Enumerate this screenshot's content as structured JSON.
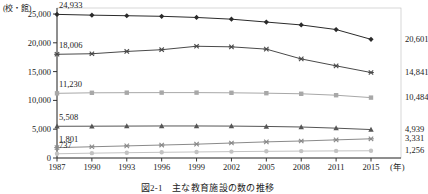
{
  "figure": {
    "unit_label": "(校・館)",
    "x_axis_unit": "(年)",
    "caption": "図2-1　主な教育施設の数の推移"
  },
  "chart_data": {
    "type": "line",
    "title": "図2-1　主な教育施設の数の推移",
    "xlabel": "(年)",
    "ylabel": "(校・館)",
    "ylim": [
      0,
      25000
    ],
    "yticks": [
      "0",
      "5,000",
      "10,000",
      "15,000",
      "20,000",
      "25,000"
    ],
    "ytick_values": [
      0,
      5000,
      10000,
      15000,
      20000,
      25000
    ],
    "grid": false,
    "legend_position": "none",
    "categories": [
      "1987",
      "1990",
      "1993",
      "1996",
      "1999",
      "2002",
      "2005",
      "2008",
      "2011",
      "2015"
    ],
    "x_values": [
      1987,
      1990,
      1993,
      1996,
      1999,
      2002,
      2005,
      2008,
      2011,
      2015
    ],
    "series": [
      {
        "name": "series-1",
        "marker": "diamond",
        "color": "#2b2b2b",
        "values": [
          24933,
          24800,
          24700,
          24600,
          24400,
          24100,
          23600,
          23100,
          22300,
          20601
        ],
        "start_label": "24,933",
        "end_label": "20,601"
      },
      {
        "name": "series-2",
        "marker": "cross",
        "color": "#4a4a4a",
        "values": [
          18006,
          18100,
          18500,
          18800,
          19400,
          19300,
          18900,
          17200,
          16000,
          14841
        ],
        "start_label": "18,006",
        "end_label": "14,841"
      },
      {
        "name": "series-3",
        "marker": "square",
        "color": "#a8a8a8",
        "values": [
          11230,
          11320,
          11340,
          11350,
          11350,
          11320,
          11250,
          11150,
          10900,
          10484
        ],
        "start_label": "11,230",
        "end_label": "10,484"
      },
      {
        "name": "series-4",
        "marker": "triangle",
        "color": "#555555",
        "values": [
          5508,
          5520,
          5540,
          5560,
          5560,
          5540,
          5480,
          5380,
          5180,
          4939
        ],
        "start_label": "5,508",
        "end_label": "4,939"
      },
      {
        "name": "series-5",
        "marker": "cross",
        "color": "#8a8a8a",
        "values": [
          1801,
          1950,
          2100,
          2250,
          2400,
          2600,
          2800,
          2950,
          3150,
          3331
        ],
        "start_label": "1,801",
        "end_label": "3,331"
      },
      {
        "name": "series-6",
        "marker": "circle",
        "color": "#c2c2c2",
        "values": [
          737,
          840,
          920,
          990,
          1050,
          1110,
          1160,
          1200,
          1230,
          1256
        ],
        "start_label": "737",
        "end_label": "1,256"
      }
    ]
  }
}
